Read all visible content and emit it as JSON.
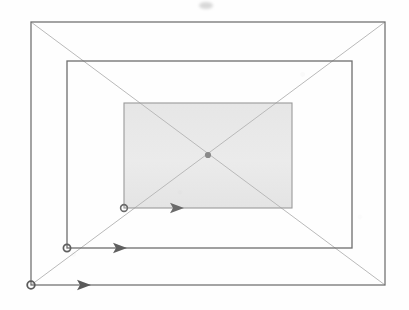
{
  "figure": {
    "canvas": {
      "width": 409,
      "height": 310,
      "background": "#fefefe"
    },
    "colors": {
      "rectangle_stroke": "#6f6f6f",
      "rectangle_stroke_faint": "#8d8d8d",
      "diagonal_stroke": "#b9b9b9",
      "axis_stroke": "#c2c2c2",
      "shaded_fill": "#e9e9e9",
      "arrow": "#636363",
      "origin_dot": "#5d5d5d",
      "smudge": "#dcdcdc"
    }
  },
  "vanishing_point": {
    "label": "vanishing point",
    "x": 208,
    "y": 155
  },
  "axes": [
    {
      "name": "horizontal-axis",
      "orientation": "horizontal",
      "y": 155,
      "x_start": 14,
      "x_end": 402,
      "color": "#c2c2c2"
    },
    {
      "name": "vertical-axis",
      "orientation": "vertical",
      "x": 208,
      "y_start": 9,
      "y_end": 301,
      "color": "#c2c2c2"
    }
  ],
  "rectangles": [
    {
      "name": "outer-rectangle",
      "order": 1,
      "x": 31,
      "y": 22,
      "width": 354,
      "height": 263,
      "fill": "none",
      "stroke": "#757575",
      "stroke_width": 1.3
    },
    {
      "name": "middle-rectangle",
      "order": 2,
      "x": 67,
      "y": 61,
      "width": 285,
      "height": 187,
      "fill": "none",
      "stroke": "#6f6f6f",
      "stroke_width": 1.3
    },
    {
      "name": "inner-rectangle",
      "order": 3,
      "x": 124,
      "y": 103,
      "width": 168,
      "height": 105,
      "fill": "#e9e9e9",
      "stroke": "#9a9a9a",
      "stroke_width": 1.1
    }
  ],
  "diagonals": [
    {
      "name": "diagonal-top-left-to-bottom-right",
      "x1": 31,
      "y1": 22,
      "x2": 385,
      "y2": 285,
      "color": "#b9b9b9"
    },
    {
      "name": "diagonal-bottom-left-to-top-right",
      "x1": 31,
      "y1": 285,
      "x2": 385,
      "y2": 22,
      "color": "#b9b9b9"
    }
  ],
  "arrows": [
    {
      "name": "arrow-inner",
      "index": 1,
      "origin_x": 124,
      "origin_y": 208,
      "tip_x": 184,
      "tip_y": 208,
      "length": 60,
      "attached_corner": "inner-rectangle bottom-left",
      "color": "#6a6a6a"
    },
    {
      "name": "arrow-middle",
      "index": 2,
      "origin_x": 67,
      "origin_y": 248,
      "tip_x": 127,
      "tip_y": 248,
      "length": 60,
      "attached_corner": "middle-rectangle bottom-left",
      "color": "#5f5f5f"
    },
    {
      "name": "arrow-outer",
      "index": 3,
      "origin_x": 31,
      "origin_y": 285,
      "tip_x": 91,
      "tip_y": 285,
      "length": 60,
      "attached_corner": "outer-rectangle bottom-left",
      "color": "#5a5a5a"
    }
  ],
  "artifacts": [
    {
      "name": "top-edge-smudge",
      "description": "faint cut-off scan mark near top center",
      "x": 199,
      "y": 2,
      "width": 14,
      "height": 7
    }
  ]
}
